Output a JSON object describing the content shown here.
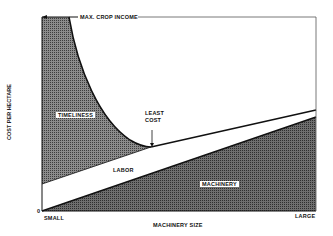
{
  "diagram": {
    "top_label": "MAX. CROP INCOME",
    "y_axis_label": "COST PER HECTARE",
    "x_axis_label": "MACHINERY SIZE",
    "x_min_label": "SMALL",
    "x_max_label": "LARGE",
    "y_origin_label": "0",
    "regions": {
      "timeliness": "TIMELINESS",
      "labor": "LABOR",
      "machinery": "MACHINERY"
    },
    "annotation": {
      "line1": "LEAST",
      "line2": "COST"
    },
    "colors": {
      "shade_dark": "#555555",
      "shade_light": "#8a8a8a",
      "line": "#111111"
    }
  }
}
